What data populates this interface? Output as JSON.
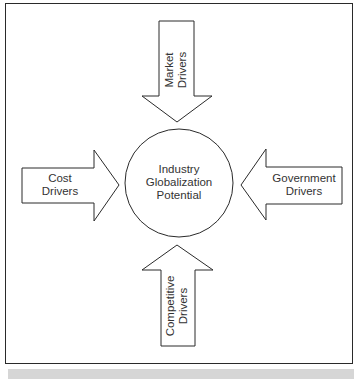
{
  "diagram": {
    "center": {
      "line1": "Industry",
      "line2": "Globalization",
      "line3": "Potential"
    },
    "arrows": {
      "market": {
        "line1": "Market",
        "line2": "Drivers",
        "direction": "down"
      },
      "cost": {
        "line1": "Cost",
        "line2": "Drivers",
        "direction": "right"
      },
      "government": {
        "line1": "Government",
        "line2": "Drivers",
        "direction": "left"
      },
      "competitive": {
        "line1": "Competitive",
        "line2": "Drivers",
        "direction": "up"
      }
    },
    "colors": {
      "stroke": "#2a2a2a",
      "fill": "#ffffff",
      "text": "#333333",
      "bar": "#d6d6d6"
    }
  }
}
